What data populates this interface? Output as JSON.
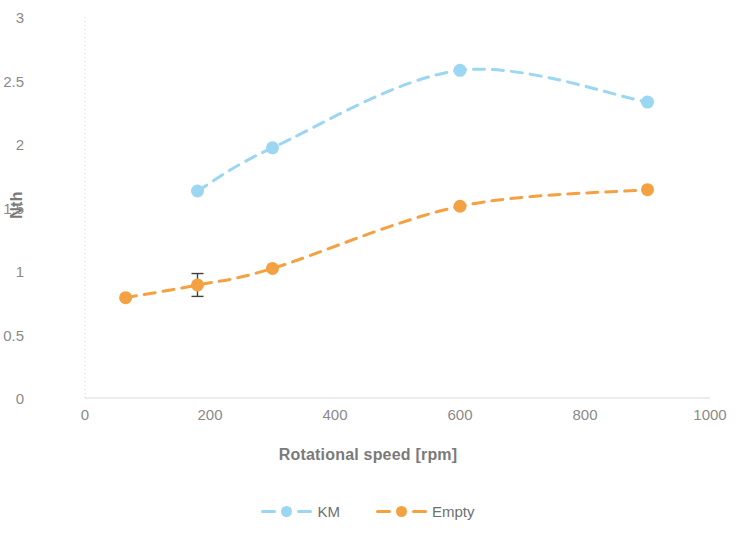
{
  "chart_data": {
    "type": "line",
    "title": "",
    "xlabel": "Rotational speed [rpm]",
    "ylabel": "Nth",
    "xlim": [
      0,
      1000
    ],
    "ylim": [
      0,
      3
    ],
    "xticks": [
      "0",
      "200",
      "400",
      "600",
      "800",
      "1000"
    ],
    "yticks": [
      "0",
      "0.5",
      "1",
      "1.5",
      "2",
      "2.5",
      "3"
    ],
    "xtick_values": [
      0,
      200,
      400,
      600,
      800,
      1000
    ],
    "ytick_values": [
      0,
      0.5,
      1,
      1.5,
      2,
      2.5,
      3
    ],
    "grid": false,
    "legend_position": "bottom",
    "line_style": "dashed",
    "marker": "circle",
    "series": [
      {
        "name": "KM",
        "color": "#9BD6F2",
        "x": [
          180,
          300,
          600,
          900
        ],
        "values": [
          1.63,
          1.97,
          2.58,
          2.33
        ],
        "errors": [
          null,
          null,
          null,
          null
        ]
      },
      {
        "name": "Empty",
        "color": "#F4A council",
        "x": [
          65,
          180,
          300,
          600,
          900
        ],
        "values": [
          0.79,
          0.89,
          1.02,
          1.51,
          1.64
        ],
        "errors": [
          null,
          0.09,
          null,
          null,
          null
        ]
      }
    ]
  },
  "colors": {
    "km": "#9BD6F2",
    "empty": "#F4A142",
    "axis": "#d9d9d9",
    "tick_text": "#8a8a8a",
    "title_text": "#7a7a7a",
    "errorbar": "#404040",
    "background": "#ffffff"
  },
  "legend": {
    "items": [
      {
        "label": "KM",
        "color": "#9BD6F2"
      },
      {
        "label": "Empty",
        "color": "#F4A142"
      }
    ]
  },
  "axes": {
    "x_title": "Rotational speed [rpm]",
    "y_title": "Nth"
  }
}
